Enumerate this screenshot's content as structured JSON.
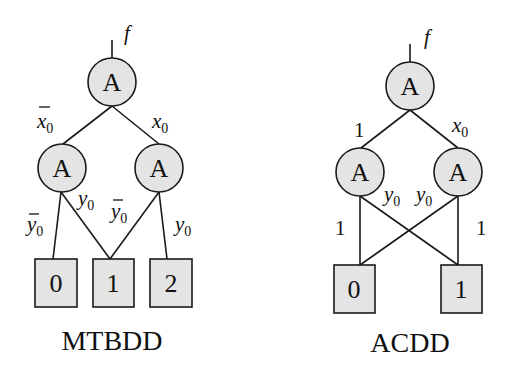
{
  "diagrams": [
    {
      "caption": "MTBDD",
      "output_label": "f",
      "root": {
        "label": "A"
      },
      "children": [
        {
          "label": "A"
        },
        {
          "label": "A"
        }
      ],
      "edge_labels": {
        "root_left": {
          "var": "x",
          "sub": "0",
          "negated": true
        },
        "root_right": {
          "var": "x",
          "sub": "0",
          "negated": false
        },
        "l_to_0": {
          "var": "y",
          "sub": "0",
          "negated": true
        },
        "l_to_1": {
          "var": "y",
          "sub": "0",
          "negated": false
        },
        "r_to_1": {
          "var": "y",
          "sub": "0",
          "negated": true
        },
        "r_to_2": {
          "var": "y",
          "sub": "0",
          "negated": false
        }
      },
      "terminals": [
        "0",
        "1",
        "2"
      ]
    },
    {
      "caption": "ACDD",
      "output_label": "f",
      "root": {
        "label": "A"
      },
      "children": [
        {
          "label": "A"
        },
        {
          "label": "A"
        }
      ],
      "edge_labels": {
        "root_left": "1",
        "root_right": {
          "var": "x",
          "sub": "0"
        },
        "l_to_0": "1",
        "l_to_1": {
          "var": "y",
          "sub": "0"
        },
        "r_to_0": {
          "var": "y",
          "sub": "0"
        },
        "r_to_1": "1"
      },
      "terminals": [
        "0",
        "1"
      ]
    }
  ],
  "text": {
    "f": "f",
    "x": "x",
    "y": "y",
    "zero_sub": "0",
    "one": "1",
    "overbar": "‾"
  }
}
